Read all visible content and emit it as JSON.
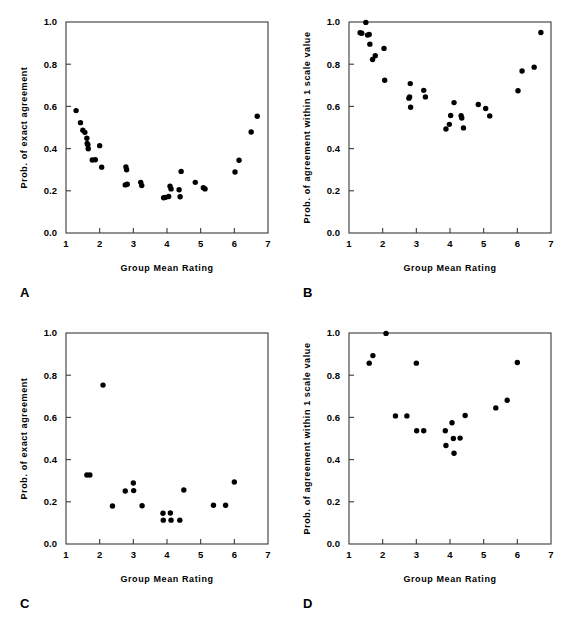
{
  "figure": {
    "panel_labels": [
      "A",
      "B",
      "C",
      "D"
    ],
    "xlabel": "Group Mean Rating",
    "ylabel_exact": "Prob. of exact agreement",
    "ylabel_within1": "Prob. of agreement within 1 scale value",
    "xticks": [
      "1",
      "2",
      "3",
      "4",
      "5",
      "6",
      "7"
    ],
    "yticks": [
      "0.0",
      "0.2",
      "0.4",
      "0.6",
      "0.8",
      "1.0"
    ],
    "dot_color": "#000000",
    "axis_color": "#3a3a3a"
  },
  "chart_data": [
    {
      "panel": "A",
      "type": "scatter",
      "title": "",
      "xlabel": "Group Mean Rating",
      "ylabel": "Prob. of exact agreement",
      "xlim": [
        1,
        7
      ],
      "ylim": [
        0.0,
        1.0
      ],
      "xticks": [
        1,
        2,
        3,
        4,
        5,
        6,
        7
      ],
      "yticks": [
        0.0,
        0.2,
        0.4,
        0.6,
        0.8,
        1.0
      ],
      "grid": false,
      "legend": "none",
      "points": [
        [
          1.3,
          0.58
        ],
        [
          1.43,
          0.523
        ],
        [
          1.5,
          0.487
        ],
        [
          1.56,
          0.477
        ],
        [
          1.62,
          0.449
        ],
        [
          1.63,
          0.424
        ],
        [
          1.65,
          0.418
        ],
        [
          1.66,
          0.399
        ],
        [
          1.78,
          0.346
        ],
        [
          1.87,
          0.347
        ],
        [
          2.0,
          0.414
        ],
        [
          2.06,
          0.312
        ],
        [
          2.78,
          0.313
        ],
        [
          2.8,
          0.3
        ],
        [
          2.76,
          0.228
        ],
        [
          2.82,
          0.231
        ],
        [
          3.22,
          0.24
        ],
        [
          3.25,
          0.225
        ],
        [
          3.9,
          0.167
        ],
        [
          3.96,
          0.169
        ],
        [
          4.05,
          0.173
        ],
        [
          4.09,
          0.222
        ],
        [
          4.12,
          0.209
        ],
        [
          4.36,
          0.205
        ],
        [
          4.39,
          0.172
        ],
        [
          4.42,
          0.292
        ],
        [
          4.84,
          0.24
        ],
        [
          5.08,
          0.215
        ],
        [
          5.13,
          0.209
        ],
        [
          6.02,
          0.289
        ],
        [
          6.14,
          0.345
        ],
        [
          6.5,
          0.479
        ],
        [
          6.68,
          0.553
        ]
      ]
    },
    {
      "panel": "B",
      "type": "scatter",
      "title": "",
      "xlabel": "Group Mean Rating",
      "ylabel": "Prob. of agreement within 1 scale value",
      "xlim": [
        1,
        7
      ],
      "ylim": [
        0.0,
        1.0
      ],
      "xticks": [
        1,
        2,
        3,
        4,
        5,
        6,
        7
      ],
      "yticks": [
        0.0,
        0.2,
        0.4,
        0.6,
        0.8,
        1.0
      ],
      "grid": false,
      "legend": "none",
      "points": [
        [
          1.33,
          0.949
        ],
        [
          1.38,
          0.947
        ],
        [
          1.5,
          0.998
        ],
        [
          1.55,
          0.938
        ],
        [
          1.6,
          0.941
        ],
        [
          1.62,
          0.895
        ],
        [
          1.7,
          0.822
        ],
        [
          1.78,
          0.84
        ],
        [
          2.04,
          0.875
        ],
        [
          2.06,
          0.724
        ],
        [
          2.78,
          0.639
        ],
        [
          2.8,
          0.645
        ],
        [
          2.82,
          0.708
        ],
        [
          2.83,
          0.596
        ],
        [
          3.22,
          0.676
        ],
        [
          3.27,
          0.645
        ],
        [
          3.88,
          0.493
        ],
        [
          3.98,
          0.515
        ],
        [
          4.02,
          0.557
        ],
        [
          4.12,
          0.618
        ],
        [
          4.33,
          0.556
        ],
        [
          4.35,
          0.545
        ],
        [
          4.4,
          0.498
        ],
        [
          4.84,
          0.609
        ],
        [
          5.06,
          0.59
        ],
        [
          5.18,
          0.555
        ],
        [
          6.02,
          0.674
        ],
        [
          6.14,
          0.768
        ],
        [
          6.5,
          0.786
        ],
        [
          6.7,
          0.95
        ]
      ]
    },
    {
      "panel": "C",
      "type": "scatter",
      "title": "",
      "xlabel": "Group Mean Rating",
      "ylabel": "Prob. of exact agreement",
      "xlim": [
        1,
        7
      ],
      "ylim": [
        0.0,
        1.0
      ],
      "xticks": [
        1,
        2,
        3,
        4,
        5,
        6,
        7
      ],
      "yticks": [
        0.0,
        0.2,
        0.4,
        0.6,
        0.8,
        1.0
      ],
      "grid": false,
      "legend": "none",
      "points": [
        [
          1.62,
          0.327
        ],
        [
          1.71,
          0.327
        ],
        [
          2.1,
          0.753
        ],
        [
          2.38,
          0.18
        ],
        [
          2.76,
          0.251
        ],
        [
          3.0,
          0.289
        ],
        [
          3.01,
          0.253
        ],
        [
          3.26,
          0.181
        ],
        [
          3.88,
          0.146
        ],
        [
          3.89,
          0.113
        ],
        [
          4.1,
          0.147
        ],
        [
          4.12,
          0.113
        ],
        [
          4.38,
          0.113
        ],
        [
          4.5,
          0.256
        ],
        [
          5.38,
          0.184
        ],
        [
          5.74,
          0.184
        ],
        [
          6.0,
          0.294
        ]
      ]
    },
    {
      "panel": "D",
      "type": "scatter",
      "title": "",
      "xlabel": "Group Mean Rating",
      "ylabel": "Prob. of agreement within 1 scale value",
      "xlim": [
        1,
        7
      ],
      "ylim": [
        0.0,
        1.0
      ],
      "xticks": [
        1,
        2,
        3,
        4,
        5,
        6,
        7
      ],
      "yticks": [
        0.0,
        0.2,
        0.4,
        0.6,
        0.8,
        1.0
      ],
      "grid": false,
      "legend": "none",
      "points": [
        [
          1.6,
          0.857
        ],
        [
          1.71,
          0.893
        ],
        [
          2.1,
          0.998
        ],
        [
          2.38,
          0.607
        ],
        [
          2.72,
          0.607
        ],
        [
          3.0,
          0.857
        ],
        [
          3.01,
          0.537
        ],
        [
          3.22,
          0.537
        ],
        [
          3.86,
          0.537
        ],
        [
          3.88,
          0.467
        ],
        [
          4.06,
          0.575
        ],
        [
          4.1,
          0.5
        ],
        [
          4.12,
          0.43
        ],
        [
          4.3,
          0.502
        ],
        [
          4.45,
          0.609
        ],
        [
          5.36,
          0.645
        ],
        [
          5.7,
          0.681
        ],
        [
          6.0,
          0.86
        ]
      ]
    }
  ]
}
